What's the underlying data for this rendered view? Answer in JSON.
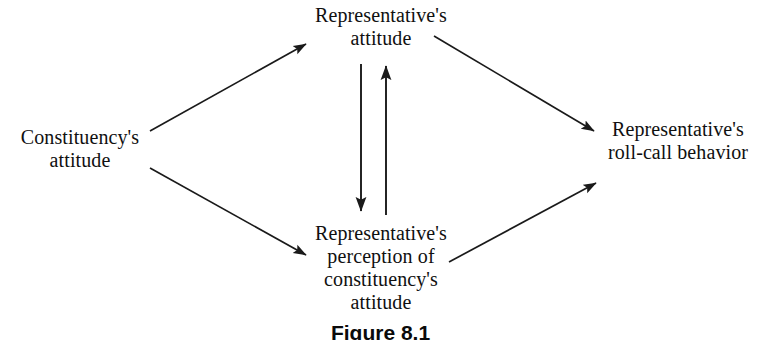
{
  "figure": {
    "caption": "Figure 8.1",
    "background_color": "#ffffff",
    "stroke_color": "#1a1a1a"
  },
  "nodes": {
    "constituency_attitude": {
      "id": "constituency-attitude",
      "lines": [
        "Constituency's",
        "attitude"
      ]
    },
    "representative_attitude": {
      "id": "representative-attitude",
      "lines": [
        "Representative's",
        "attitude"
      ]
    },
    "representative_perception": {
      "id": "representative-perception",
      "lines": [
        "Representative's",
        "perception of",
        "constituency's",
        "attitude"
      ]
    },
    "representative_roll_call": {
      "id": "representative-roll-call",
      "lines": [
        "Representative's",
        "roll-call behavior"
      ]
    }
  },
  "edges": [
    {
      "name": "constituency-attitude-to-representative-attitude",
      "from": "constituency_attitude",
      "to": "representative_attitude",
      "x1": 150,
      "y1": 131,
      "x2": 306,
      "y2": 44
    },
    {
      "name": "constituency-attitude-to-representative-perception",
      "from": "constituency_attitude",
      "to": "representative_perception",
      "x1": 150,
      "y1": 168,
      "x2": 306,
      "y2": 255
    },
    {
      "name": "representative-attitude-to-roll-call",
      "from": "representative_attitude",
      "to": "representative_roll_call",
      "x1": 434,
      "y1": 36,
      "x2": 594,
      "y2": 131
    },
    {
      "name": "representative-perception-to-roll-call",
      "from": "representative_perception",
      "to": "representative_roll_call",
      "x1": 449,
      "y1": 262,
      "x2": 596,
      "y2": 183
    },
    {
      "name": "representative-attitude-to-perception",
      "from": "representative_attitude",
      "to": "representative_perception",
      "x1": 361,
      "y1": 64,
      "x2": 361,
      "y2": 213
    },
    {
      "name": "representative-perception-to-attitude",
      "from": "representative_perception",
      "to": "representative_attitude",
      "x1": 386,
      "y1": 215,
      "x2": 386,
      "y2": 64
    }
  ]
}
